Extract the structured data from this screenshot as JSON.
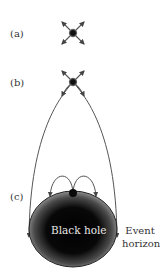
{
  "panels": [
    {
      "label": "(a)",
      "description": "Light emitted in all directions from a point source far from black hole"
    },
    {
      "label": "(b)",
      "description": "Light paths bent downward near black hole; some curve back"
    },
    {
      "label": "(c)",
      "description": "At event horizon, all light curves back into black hole"
    }
  ],
  "black_hole": {
    "label": "Black hole"
  },
  "event_horizon": {
    "line1": "Event",
    "line2": "horizon"
  },
  "colors": {
    "arrow": "#555555",
    "dot": "#111111",
    "dot_halo": "#888888",
    "hole_center": "#050505",
    "hole_edge": "#9a9a9a"
  }
}
